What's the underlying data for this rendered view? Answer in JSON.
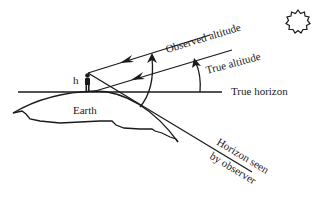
{
  "diagram": {
    "type": "astronomical-refraction-diagram",
    "labels": {
      "observed_altitude": "Observed altitude",
      "true_altitude": "True altitude",
      "true_horizon": "True horizon",
      "earth": "Earth",
      "height": "h",
      "horizon_seen_line1": "Horizon seen",
      "horizon_seen_line2": "by observer"
    },
    "icons": {
      "sun": "sun-icon",
      "observer": "person-icon"
    },
    "colors": {
      "stroke": "#1a1a1a",
      "background": "#ffffff"
    }
  }
}
